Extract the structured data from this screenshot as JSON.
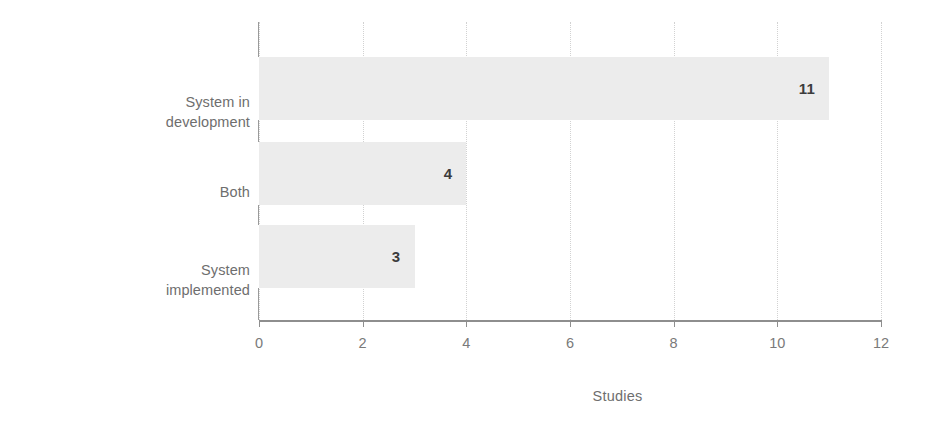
{
  "chart_data": {
    "type": "bar",
    "orientation": "horizontal",
    "title": "",
    "xlabel": "Studies",
    "ylabel": "Evaluation type",
    "categories": [
      "System in development",
      "Both",
      "System implemented"
    ],
    "category_lines": [
      [
        "System in",
        "development"
      ],
      [
        "Both"
      ],
      [
        "System",
        "implemented"
      ]
    ],
    "values": [
      11,
      4,
      3
    ],
    "value_labels": [
      "11",
      "4",
      "3"
    ],
    "xlim": [
      0,
      12
    ],
    "xticks": [
      0,
      2,
      4,
      6,
      8,
      10,
      12
    ],
    "xtick_labels": [
      "0",
      "2",
      "4",
      "6",
      "8",
      "10",
      "12"
    ],
    "grid": "vertical-dotted",
    "legend": "none",
    "colors": {
      "bar_fill": "#ececec",
      "value_label": "#3c3c3c",
      "tick_label": "#7a7a7a",
      "axis_title": "#6e6e6e",
      "category_label": "#6e6e6e",
      "gridline": "#d2d2d2",
      "axis_line": "#8e8e8e",
      "background": "#ffffff"
    }
  }
}
